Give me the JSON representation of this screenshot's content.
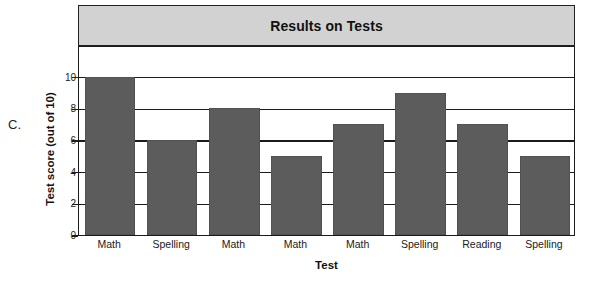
{
  "figure": {
    "letter_label": "C."
  },
  "chart_data": {
    "type": "bar",
    "title": "Results on Tests",
    "xlabel": "Test",
    "ylabel": "Test score (out of 10)",
    "categories": [
      "Math",
      "Spelling",
      "Math",
      "Math",
      "Math",
      "Spelling",
      "Reading",
      "Spelling"
    ],
    "values": [
      10,
      6,
      8,
      5,
      7,
      9,
      7,
      5
    ],
    "ylim": [
      0,
      12
    ],
    "yticks": [
      0,
      2,
      4,
      6,
      8,
      10
    ],
    "ytick_labels": [
      "0",
      "2",
      "4",
      "6",
      "8",
      "10"
    ],
    "gridlines": [
      0,
      2,
      4,
      6,
      8,
      10,
      12
    ],
    "grid": true,
    "legend": null,
    "bar_color": "#5c5c5c",
    "title_band_color": "#d2d2d2",
    "axis_color": "#1b1b1b"
  }
}
